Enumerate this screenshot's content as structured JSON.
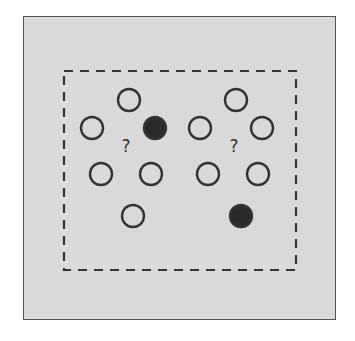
{
  "diagram": {
    "outer_box": {
      "x": 23,
      "y": 16,
      "w": 313,
      "h": 304,
      "fill": "#d9d9d9",
      "stroke": "#555555"
    },
    "dashed_box": {
      "x": 64,
      "y": 71,
      "w": 232,
      "h": 199,
      "stroke": "#333333"
    },
    "circle_radius": 11,
    "circles": [
      {
        "x": 129,
        "y": 100,
        "filled": false
      },
      {
        "x": 92,
        "y": 128,
        "filled": false
      },
      {
        "x": 155,
        "y": 128,
        "filled": true
      },
      {
        "x": 101,
        "y": 174,
        "filled": false
      },
      {
        "x": 151,
        "y": 174,
        "filled": false
      },
      {
        "x": 133,
        "y": 216,
        "filled": false
      },
      {
        "x": 236,
        "y": 100,
        "filled": false
      },
      {
        "x": 200,
        "y": 128,
        "filled": false
      },
      {
        "x": 262,
        "y": 128,
        "filled": false
      },
      {
        "x": 208,
        "y": 174,
        "filled": false
      },
      {
        "x": 258,
        "y": 174,
        "filled": false
      },
      {
        "x": 241,
        "y": 216,
        "filled": true
      }
    ],
    "labels": [
      {
        "text": "?",
        "x": 126,
        "y": 152
      },
      {
        "text": "?",
        "x": 234,
        "y": 152
      }
    ],
    "colors": {
      "stroke": "#333333",
      "filled": "#2a2a2a"
    }
  }
}
